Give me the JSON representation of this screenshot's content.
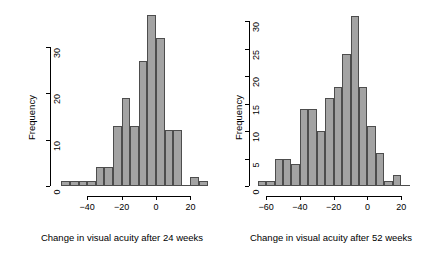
{
  "figure": {
    "background": "#ffffff",
    "bar_fill": "#a3a3a3",
    "bar_border": "#4d4d4d",
    "axis_color": "#000000"
  },
  "chart_data": [
    {
      "type": "bar",
      "subtype": "histogram",
      "panel": "left",
      "title": "",
      "xlabel": "Change in visual acuity after 24 weeks",
      "ylabel": "Frequency",
      "xlim": [
        -57.5,
        32.5
      ],
      "ylim": [
        0,
        38
      ],
      "xticks": [
        -40,
        -20,
        0,
        20
      ],
      "xticklabels": [
        "-40",
        "-20",
        "0",
        "20"
      ],
      "yticks": [
        0,
        10,
        20,
        30
      ],
      "yticklabels": [
        "0",
        "10",
        "20",
        "30"
      ],
      "grid": false,
      "legend": null,
      "bin_width": 5,
      "bin_edges": [
        -55,
        -50,
        -45,
        -40,
        -35,
        -30,
        -25,
        -20,
        -15,
        -10,
        -5,
        0,
        5,
        10,
        15,
        20,
        25,
        30
      ],
      "bin_centers": [
        -52.5,
        -47.5,
        -42.5,
        -37.5,
        -32.5,
        -27.5,
        -22.5,
        -17.5,
        -12.5,
        -7.5,
        -2.5,
        2.5,
        7.5,
        12.5,
        17.5,
        22.5,
        27.5
      ],
      "values": [
        1,
        1,
        1,
        1,
        4,
        4,
        13,
        19,
        13,
        27,
        37,
        32,
        12,
        12,
        0,
        2,
        1
      ]
    },
    {
      "type": "bar",
      "subtype": "histogram",
      "panel": "right",
      "title": "",
      "xlabel": "Change in visual acuity after 52 weeks",
      "ylabel": "Frequency",
      "xlim": [
        -66,
        27
      ],
      "ylim": [
        0,
        32
      ],
      "xticks": [
        -60,
        -40,
        -20,
        0,
        20
      ],
      "xticklabels": [
        "-60",
        "-40",
        "-20",
        "0",
        "20"
      ],
      "yticks": [
        0,
        5,
        10,
        15,
        20,
        25,
        30
      ],
      "yticklabels": [
        "0",
        "5",
        "10",
        "15",
        "20",
        "25",
        "30"
      ],
      "grid": false,
      "legend": null,
      "bin_width": 5,
      "bin_edges": [
        -65,
        -60,
        -55,
        -50,
        -45,
        -40,
        -35,
        -30,
        -25,
        -20,
        -15,
        -10,
        -5,
        0,
        5,
        10,
        15,
        20,
        25
      ],
      "bin_centers": [
        -62.5,
        -57.5,
        -52.5,
        -47.5,
        -42.5,
        -37.5,
        -32.5,
        -27.5,
        -22.5,
        -17.5,
        -12.5,
        -7.5,
        -2.5,
        2.5,
        7.5,
        12.5,
        17.5,
        22.5
      ],
      "values": [
        1,
        1,
        5,
        5,
        4,
        14,
        14,
        10,
        16,
        18,
        24,
        31,
        18,
        11,
        6,
        1,
        2,
        0
      ]
    }
  ]
}
